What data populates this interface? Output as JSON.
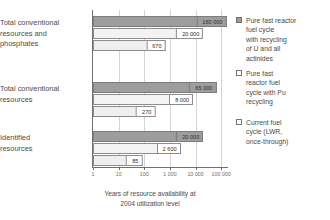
{
  "chart_data": {
    "type": "bar",
    "orientation": "horizontal",
    "xscale": "log",
    "title": "",
    "xlabel": "Years of resource availability at 2004 utilization level",
    "xlabel_lines": [
      "Years of resource availability at",
      "2004 utilization level"
    ],
    "ylabel": "",
    "xlim": [
      1,
      200000
    ],
    "grid": true,
    "legend_position": "right",
    "tick_labels": [
      "1",
      "10",
      "100",
      "1 000",
      "10 000",
      "100 000"
    ],
    "tick_values": [
      1,
      10,
      100,
      1000,
      10000,
      100000
    ],
    "categories": [
      "Total conventional resources and phosphates",
      "Total conventional resources",
      "Identified resources"
    ],
    "category_lines": [
      [
        "Total conventional",
        "resources and",
        "phosphates"
      ],
      [
        "Total conventional",
        "resources"
      ],
      [
        "Identified",
        "resources"
      ]
    ],
    "series": [
      {
        "name": "Pure fast reactor fuel cycle with recycling of U and all actinides",
        "name_lines": [
          "Pure fast reactor",
          "fuel cycle",
          "with recycling",
          "of U and all",
          "actinides"
        ],
        "color": "#9d9d9d",
        "values": [
          160000,
          65000,
          20000
        ],
        "value_labels": [
          "160 000",
          "65 000",
          "20 000"
        ]
      },
      {
        "name": "Pure fast reactor fuel cycle with Pu recycling",
        "name_lines": [
          "Pure fast",
          "reactor fuel",
          "cycle with Pu",
          "recycling"
        ],
        "color": "#f3f3f3",
        "values": [
          20000,
          8000,
          2600
        ],
        "value_labels": [
          "20 000",
          "8 000",
          "2 600"
        ]
      },
      {
        "name": "Current fuel cycle (LWR, once-through)",
        "name_lines": [
          "Current fuel",
          "cycle (LWR,",
          "once-through)"
        ],
        "color": "#efefef",
        "values": [
          670,
          270,
          85
        ],
        "value_labels": [
          "670",
          "270",
          "85"
        ]
      }
    ]
  },
  "colors": {
    "series_dark": "#9d9d9d",
    "series_light": "#f3f3f3",
    "series_lighter": "#efefef",
    "axis": "#6f6f6f",
    "grid": "#d4d4d4",
    "text": "#4a4a4a"
  }
}
